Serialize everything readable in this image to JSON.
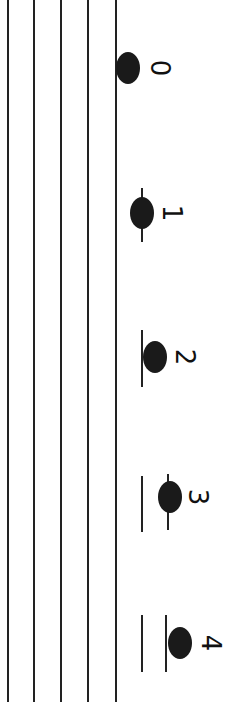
{
  "diagram": {
    "type": "music-staff-rotated-90",
    "staff_lines_x": [
      8,
      34,
      61,
      88,
      116
    ],
    "notes": [
      {
        "label": "0",
        "x": 128,
        "y": 68,
        "label_x": 160,
        "label_y": 68,
        "ledgers": []
      },
      {
        "label": "1",
        "x": 142,
        "y": 213,
        "label_x": 172,
        "label_y": 213,
        "ledgers": [
          {
            "x": 142,
            "y1": 188,
            "y2": 242
          }
        ]
      },
      {
        "label": "2",
        "x": 155,
        "y": 357,
        "label_x": 185,
        "label_y": 357,
        "ledgers": [
          {
            "x": 142,
            "y1": 330,
            "y2": 387
          }
        ]
      },
      {
        "label": "3",
        "x": 170,
        "y": 497,
        "label_x": 198,
        "label_y": 497,
        "ledgers": [
          {
            "x": 142,
            "y1": 476,
            "y2": 532
          },
          {
            "x": 168,
            "y1": 474,
            "y2": 530
          }
        ]
      },
      {
        "label": "4",
        "x": 180,
        "y": 643,
        "label_x": 211,
        "label_y": 643,
        "ledgers": [
          {
            "x": 142,
            "y1": 615,
            "y2": 672
          },
          {
            "x": 166,
            "y1": 615,
            "y2": 672
          }
        ]
      }
    ]
  }
}
